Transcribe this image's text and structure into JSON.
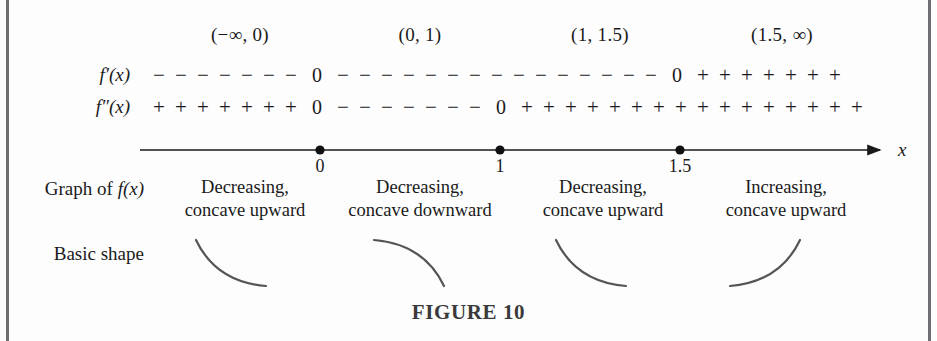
{
  "figure": {
    "caption": "FIGURE 10",
    "axis_variable": "x"
  },
  "intervals": [
    {
      "label": "(−∞, 0)"
    },
    {
      "label": "(0, 1)"
    },
    {
      "label": "(1, 1.5)"
    },
    {
      "label": "(1.5, ∞)"
    }
  ],
  "rows": {
    "first_derivative": {
      "label": "f′(x)",
      "label_plain": "f'(x)",
      "segments": [
        {
          "sign": "−",
          "count": 7
        },
        {
          "sign": "0",
          "count": 1
        },
        {
          "sign": "−",
          "count": 15
        },
        {
          "sign": "0",
          "count": 1
        },
        {
          "sign": "+",
          "count": 7
        }
      ]
    },
    "second_derivative": {
      "label": "f″(x)",
      "label_plain": "f''(x)",
      "segments": [
        {
          "sign": "+",
          "count": 7
        },
        {
          "sign": "0",
          "count": 1
        },
        {
          "sign": "−",
          "count": 7
        },
        {
          "sign": "0",
          "count": 1
        },
        {
          "sign": "+",
          "count": 16
        }
      ]
    },
    "graph_of_f": {
      "label": "Graph of f(x)",
      "label_prefix": "Graph of ",
      "label_func": "f(x)",
      "cells": [
        {
          "line1": "Decreasing,",
          "line2": "concave upward"
        },
        {
          "line1": "Decreasing,",
          "line2": "concave downward"
        },
        {
          "line1": "Decreasing,",
          "line2": "concave upward"
        },
        {
          "line1": "Increasing,",
          "line2": "concave upward"
        }
      ]
    },
    "basic_shape": {
      "label": "Basic shape",
      "shapes": [
        {
          "name": "decreasing-concave-up-arc"
        },
        {
          "name": "decreasing-concave-down-arc"
        },
        {
          "name": "decreasing-concave-up-arc"
        },
        {
          "name": "increasing-concave-up-arc"
        }
      ]
    }
  },
  "axis": {
    "ticks": [
      {
        "value": "0"
      },
      {
        "value": "1"
      },
      {
        "value": "1.5"
      }
    ]
  },
  "colors": {
    "ink": "#1a1a1a",
    "border": "#6e6e72",
    "curve": "#555558",
    "caption": "#3a3a3a"
  }
}
